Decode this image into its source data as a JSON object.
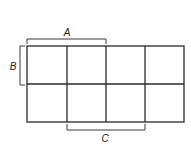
{
  "diagram": {
    "type": "karnaugh-map",
    "rows": 2,
    "cols": 4,
    "grid": {
      "x": 27,
      "y": 46,
      "width": 157,
      "height": 76
    },
    "line_color": "#2a2a2a",
    "labels": {
      "a": "A",
      "b": "B",
      "c": "C"
    },
    "brackets": {
      "a": {
        "label": "A",
        "side": "top",
        "spans_columns": [
          1,
          2
        ]
      },
      "b": {
        "label": "B",
        "side": "left",
        "spans_rows": [
          1
        ]
      },
      "c": {
        "label": "C",
        "side": "bottom",
        "spans_columns": [
          2,
          3
        ]
      }
    }
  }
}
